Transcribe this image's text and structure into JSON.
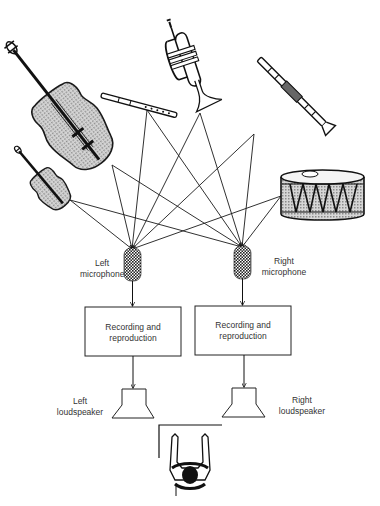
{
  "diagram": {
    "sources": [
      {
        "id": "cello",
        "name": "Cello",
        "icon": "cello-icon"
      },
      {
        "id": "violin",
        "name": "Violin",
        "icon": "violin-icon"
      },
      {
        "id": "flute",
        "name": "Flute",
        "icon": "flute-icon"
      },
      {
        "id": "trumpet",
        "name": "Trumpet",
        "icon": "trumpet-icon"
      },
      {
        "id": "clarinet",
        "name": "Clarinet",
        "icon": "clarinet-icon"
      },
      {
        "id": "drum",
        "name": "Drum",
        "icon": "drum-icon"
      }
    ],
    "left_channel": {
      "microphone_label_1": "Left",
      "microphone_label_2": "microphone",
      "box_line_1": "Recording and",
      "box_line_2": "reproduction",
      "speaker_label_1": "Left",
      "speaker_label_2": "loudspeaker"
    },
    "right_channel": {
      "microphone_label_1": "Right",
      "microphone_label_2": "microphone",
      "box_line_1": "Recording and",
      "box_line_2": "reproduction",
      "speaker_label_1": "Right",
      "speaker_label_2": "loudspeaker"
    },
    "listener": {
      "name": "Listener",
      "icon": "listener-icon"
    },
    "colors": {
      "line": "#1a1a1a",
      "fill": "#bdbdbd",
      "text": "#333333"
    }
  }
}
